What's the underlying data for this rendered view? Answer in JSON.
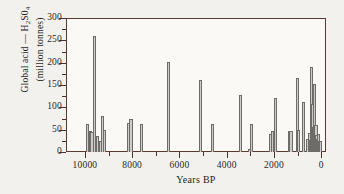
{
  "chart_data": {
    "type": "bar",
    "title": "",
    "subtitle": "",
    "xlabel": "Years BP",
    "ylabel_line1": "Global acid — H₂S0₄",
    "ylabel_line2": "(million tonnes)",
    "xlim": [
      10800,
      -200
    ],
    "ylim": [
      0,
      300
    ],
    "x_axis_reversed": true,
    "grid": false,
    "legend": null,
    "y_ticks": [
      0,
      50,
      100,
      150,
      200,
      250,
      300
    ],
    "y_tick_labels": [
      "0",
      "50",
      "100",
      "150",
      "200",
      "250",
      "300"
    ],
    "y_minor_tick_step": 25,
    "x_ticks": [
      10000,
      8000,
      6000,
      4000,
      2000,
      0
    ],
    "x_tick_labels": [
      "10000",
      "8000",
      "6000",
      "4000",
      "2000",
      "0"
    ],
    "x_minor_tick_step": 1000,
    "bar_face_color": "#cdcbc7",
    "bar_edge_color": "#6e6c69",
    "frame_color": "#5a3a33",
    "background_color": "#f3f1ed",
    "plot_background_color": "#faf9f6",
    "xlabel_note": "Years before present, axis runs from 10000 at left to 0 at right",
    "points": [
      {
        "x": 9900,
        "y": 62
      },
      {
        "x": 9750,
        "y": 47
      },
      {
        "x": 9700,
        "y": 44
      },
      {
        "x": 9600,
        "y": 260
      },
      {
        "x": 9520,
        "y": 18
      },
      {
        "x": 9450,
        "y": 35
      },
      {
        "x": 9350,
        "y": 24
      },
      {
        "x": 9250,
        "y": 80
      },
      {
        "x": 9170,
        "y": 50
      },
      {
        "x": 8150,
        "y": 65
      },
      {
        "x": 8050,
        "y": 75
      },
      {
        "x": 7600,
        "y": 62
      },
      {
        "x": 6450,
        "y": 202
      },
      {
        "x": 5100,
        "y": 161
      },
      {
        "x": 4600,
        "y": 62
      },
      {
        "x": 3400,
        "y": 128
      },
      {
        "x": 3050,
        "y": 6
      },
      {
        "x": 2950,
        "y": 62
      },
      {
        "x": 2150,
        "y": 40
      },
      {
        "x": 2080,
        "y": 48
      },
      {
        "x": 1950,
        "y": 122
      },
      {
        "x": 1350,
        "y": 48
      },
      {
        "x": 1280,
        "y": 48
      },
      {
        "x": 1000,
        "y": 166
      },
      {
        "x": 950,
        "y": 49
      },
      {
        "x": 750,
        "y": 113
      },
      {
        "x": 560,
        "y": 30
      },
      {
        "x": 500,
        "y": 42
      },
      {
        "x": 450,
        "y": 26
      },
      {
        "x": 400,
        "y": 191
      },
      {
        "x": 350,
        "y": 108
      },
      {
        "x": 320,
        "y": 56
      },
      {
        "x": 290,
        "y": 152
      },
      {
        "x": 250,
        "y": 46
      },
      {
        "x": 220,
        "y": 60
      },
      {
        "x": 190,
        "y": 38
      },
      {
        "x": 160,
        "y": 30
      },
      {
        "x": 130,
        "y": 26
      },
      {
        "x": 100,
        "y": 40
      },
      {
        "x": 70,
        "y": 24
      },
      {
        "x": 40,
        "y": 25
      }
    ]
  }
}
